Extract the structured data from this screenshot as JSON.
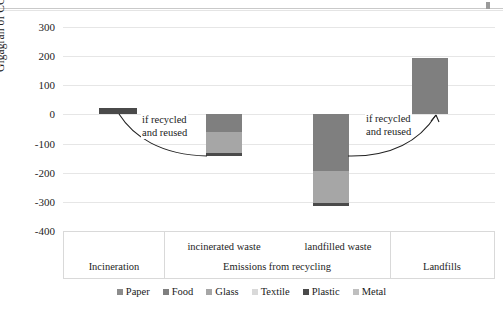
{
  "chart_data": {
    "type": "bar",
    "title": "",
    "subtitle": "",
    "xlabel": "",
    "ylabel": "Gigagran of CO2-eq",
    "ylim": [
      -400,
      300
    ],
    "ytick_step": 100,
    "yticks": [
      "300",
      "200",
      "100",
      "0",
      "-100",
      "-200",
      "-300",
      "-400"
    ],
    "grid": true,
    "stacked": true,
    "legend_position": "bottom",
    "legend": [
      "Paper",
      "Food",
      "Glass",
      "Textile",
      "Plastic",
      "Metal"
    ],
    "series_colors": {
      "Paper": "#8c8c8c",
      "Food": "#7f7f7f",
      "Glass": "#a6a6a6",
      "Textile": "#d9d9d9",
      "Plastic": "#4a4a4a",
      "Metal": "#bfbfbf"
    },
    "categories": [
      "Incineration",
      "incinerated waste",
      "landfilled waste",
      "Landfills"
    ],
    "group_labels": [
      "Incineration",
      "Emissions from recycling",
      "Landfills"
    ],
    "series": [
      {
        "name": "Paper",
        "values": [
          0,
          0,
          0,
          0
        ]
      },
      {
        "name": "Food",
        "values": [
          0,
          -62,
          -195,
          195
        ]
      },
      {
        "name": "Glass",
        "values": [
          0,
          -72,
          -110,
          0
        ]
      },
      {
        "name": "Textile",
        "values": [
          0,
          0,
          0,
          0
        ]
      },
      {
        "name": "Plastic",
        "values": [
          22,
          -8,
          -8,
          0
        ]
      },
      {
        "name": "Metal",
        "values": [
          0,
          0,
          0,
          0
        ]
      }
    ],
    "totals": [
      22,
      -142,
      -313,
      195
    ],
    "annotations": [
      {
        "text_line1": "if recycled",
        "text_line2": "and reused"
      },
      {
        "text_line1": "if recycled",
        "text_line2": "and reused"
      }
    ]
  },
  "axis": {
    "y_title": "Gigagran of CO2-eq",
    "ticks": [
      "300",
      "200",
      "100",
      "0",
      "-100",
      "-200",
      "-300",
      "-400"
    ]
  },
  "categories": {
    "sub": [
      {
        "label": "incinerated waste"
      },
      {
        "label": "landfilled waste"
      }
    ],
    "main": [
      {
        "label": "Incineration"
      },
      {
        "label": "Emissions from recycling"
      },
      {
        "label": "Landfills"
      }
    ]
  },
  "annotations": {
    "left": {
      "line1": "if recycled",
      "line2": "and reused"
    },
    "right": {
      "line1": "if recycled",
      "line2": "and reused"
    }
  },
  "legend": {
    "items": [
      {
        "label": "Paper",
        "color": "#8c8c8c"
      },
      {
        "label": "Food",
        "color": "#7f7f7f"
      },
      {
        "label": "Glass",
        "color": "#a6a6a6"
      },
      {
        "label": "Textile",
        "color": "#d9d9d9"
      },
      {
        "label": "Plastic",
        "color": "#4a4a4a"
      },
      {
        "label": "Metal",
        "color": "#bfbfbf"
      }
    ]
  }
}
